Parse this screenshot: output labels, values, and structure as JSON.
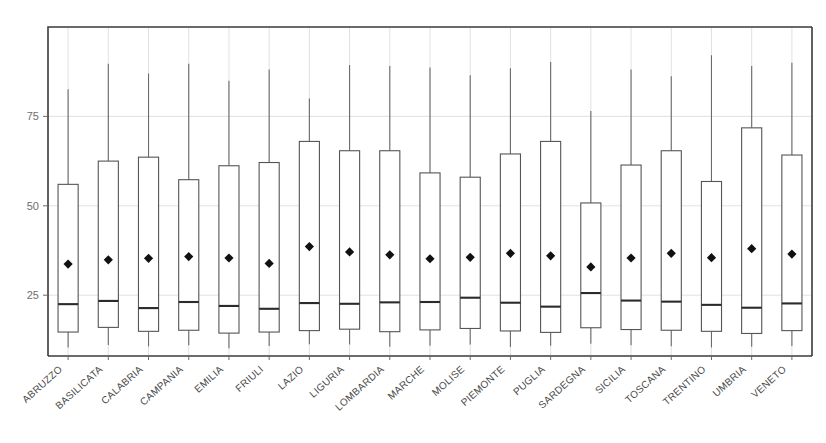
{
  "chart_data": {
    "type": "box",
    "title": "",
    "xlabel": "",
    "ylabel": "",
    "ylim": [
      8,
      100
    ],
    "yticks": [
      25,
      50,
      75
    ],
    "ytick_labels": [
      "25",
      "50",
      "75"
    ],
    "grid": true,
    "grid_axis": "y",
    "legend": false,
    "categories": [
      "ABRUZZO",
      "BASILICATA",
      "CALABRIA",
      "CAMPANIA",
      "EMILIA",
      "FRIULI",
      "LAZIO",
      "LIGURIA",
      "LOMBARDIA",
      "MARCHE",
      "MOLISE",
      "PIEMONTE",
      "PUGLIA",
      "SARDEGNA",
      "SICILIA",
      "TOSCANA",
      "TRENTINO",
      "UMBRIA",
      "VENETO"
    ],
    "series": [
      {
        "name": "ABRUZZO",
        "whisker_high": 82.6,
        "q3": 56.0,
        "median": 22.5,
        "q1": 14.7,
        "whisker_low": 10.4,
        "mean": 33.7
      },
      {
        "name": "BASILICATA",
        "whisker_high": 89.7,
        "q3": 62.5,
        "median": 23.4,
        "q1": 16.0,
        "whisker_low": 11.1,
        "mean": 34.9
      },
      {
        "name": "CALABRIA",
        "whisker_high": 87.0,
        "q3": 63.6,
        "median": 21.4,
        "q1": 14.9,
        "whisker_low": 10.7,
        "mean": 35.3
      },
      {
        "name": "CAMPANIA",
        "whisker_high": 89.7,
        "q3": 57.3,
        "median": 23.1,
        "q1": 15.2,
        "whisker_low": 11.0,
        "mean": 35.8
      },
      {
        "name": "EMILIA",
        "whisker_high": 85.0,
        "q3": 61.2,
        "median": 22.0,
        "q1": 14.4,
        "whisker_low": 10.2,
        "mean": 35.4
      },
      {
        "name": "FRIULI",
        "whisker_high": 88.1,
        "q3": 62.1,
        "median": 21.2,
        "q1": 14.7,
        "whisker_low": 10.8,
        "mean": 33.9
      },
      {
        "name": "LAZIO",
        "whisker_high": 80.0,
        "q3": 68.0,
        "median": 22.8,
        "q1": 15.1,
        "whisker_low": 11.3,
        "mean": 38.6
      },
      {
        "name": "LIGURIA",
        "whisker_high": 89.4,
        "q3": 65.4,
        "median": 22.6,
        "q1": 15.5,
        "whisker_low": 11.2,
        "mean": 37.1
      },
      {
        "name": "LOMBARDIA",
        "whisker_high": 89.1,
        "q3": 65.4,
        "median": 23.0,
        "q1": 14.8,
        "whisker_low": 10.6,
        "mean": 36.3
      },
      {
        "name": "MARCHE",
        "whisker_high": 88.7,
        "q3": 59.2,
        "median": 23.1,
        "q1": 15.3,
        "whisker_low": 10.9,
        "mean": 35.2
      },
      {
        "name": "MOLISE",
        "whisker_high": 86.5,
        "q3": 58.0,
        "median": 24.3,
        "q1": 15.7,
        "whisker_low": 11.2,
        "mean": 35.6
      },
      {
        "name": "PIEMONTE",
        "whisker_high": 88.5,
        "q3": 64.5,
        "median": 22.9,
        "q1": 15.0,
        "whisker_low": 10.5,
        "mean": 36.7
      },
      {
        "name": "PUGLIA",
        "whisker_high": 90.2,
        "q3": 68.0,
        "median": 21.8,
        "q1": 14.6,
        "whisker_low": 10.9,
        "mean": 36.0
      },
      {
        "name": "SARDEGNA",
        "whisker_high": 76.5,
        "q3": 50.8,
        "median": 25.6,
        "q1": 15.9,
        "whisker_low": 11.4,
        "mean": 32.9
      },
      {
        "name": "SICILIA",
        "whisker_high": 88.1,
        "q3": 61.4,
        "median": 23.5,
        "q1": 15.4,
        "whisker_low": 11.0,
        "mean": 35.4
      },
      {
        "name": "TOSCANA",
        "whisker_high": 86.2,
        "q3": 65.4,
        "median": 23.2,
        "q1": 15.2,
        "whisker_low": 10.7,
        "mean": 36.7
      },
      {
        "name": "TRENTINO",
        "whisker_high": 92.1,
        "q3": 56.8,
        "median": 22.3,
        "q1": 14.9,
        "whisker_low": 10.4,
        "mean": 35.5
      },
      {
        "name": "UMBRIA",
        "whisker_high": 89.1,
        "q3": 71.8,
        "median": 21.5,
        "q1": 14.3,
        "whisker_low": 10.6,
        "mean": 38.0
      },
      {
        "name": "VENETO",
        "whisker_high": 90.0,
        "q3": 64.2,
        "median": 22.7,
        "q1": 15.1,
        "whisker_low": 10.8,
        "mean": 36.5
      }
    ],
    "colors": {
      "box_fill": "#ffffff",
      "box_stroke": "#555555",
      "median": "#2b2b2b",
      "whisker": "#6a6a6a",
      "mean": "#111111",
      "axis": "#3a3a3a",
      "grid": "#d9d9d9",
      "tick_text": "#6e6e6e",
      "category_text": "#4a4a4a"
    }
  }
}
